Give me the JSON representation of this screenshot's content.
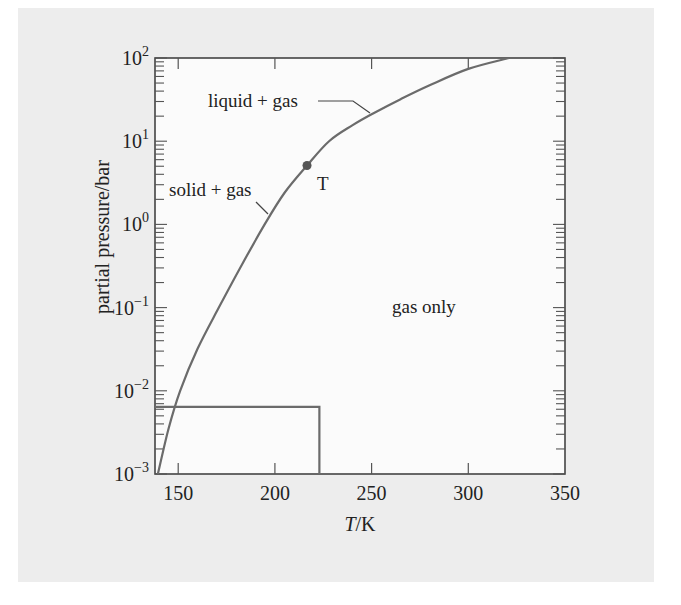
{
  "chart_data": {
    "type": "line",
    "title": "",
    "xlabel": "T/K",
    "xlabel_italic_part": "T",
    "xlabel_rest": "/K",
    "ylabel": "partial pressure/bar",
    "yscale": "log",
    "xlim": [
      138,
      350
    ],
    "ylim": [
      0.001,
      100
    ],
    "x_ticks": [
      150,
      200,
      250,
      300,
      350
    ],
    "x_tick_labels": [
      "150",
      "200",
      "250",
      "300",
      "350"
    ],
    "y_ticks": [
      0.001,
      0.01,
      0.1,
      1,
      10,
      100
    ],
    "y_tick_labels": [
      {
        "base": "10",
        "exp": "−3"
      },
      {
        "base": "10",
        "exp": "−2"
      },
      {
        "base": "10",
        "exp": "−1"
      },
      {
        "base": "10",
        "exp": "0"
      },
      {
        "base": "10",
        "exp": "1"
      },
      {
        "base": "10",
        "exp": "2"
      }
    ],
    "grid": false,
    "series": [
      {
        "name": "phase boundary",
        "color": "#6b6b6b",
        "x": [
          139.5,
          145,
          151,
          160,
          171,
          183,
          194.7,
          205,
          216.6,
          228,
          240,
          251,
          265,
          280,
          300,
          321
        ],
        "y": [
          0.001,
          0.0035,
          0.01,
          0.032,
          0.1,
          0.33,
          1.0,
          2.4,
          5.1,
          10.0,
          15.5,
          21.7,
          32,
          47,
          74,
          100
        ]
      },
      {
        "name": "reference box",
        "color": "#6b6b6b",
        "x": [
          138,
          223,
          223
        ],
        "y": [
          0.0064,
          0.0064,
          0.001
        ]
      }
    ],
    "points": [
      {
        "label": "T",
        "x": 216.6,
        "y": 5.1,
        "color": "#555555"
      }
    ],
    "annotations": [
      {
        "text": "liquid + gas",
        "x": 188,
        "y": 32,
        "leader_to": {
          "x": 251,
          "y": 21.7
        }
      },
      {
        "text": "solid + gas",
        "x": 146,
        "y": 2.7,
        "leader_to": {
          "x": 199,
          "y": 1.3
        }
      },
      {
        "text": "gas only",
        "x": 258,
        "y": 0.1
      }
    ]
  },
  "labels": {
    "triple_point": "T",
    "liquid_gas": "liquid + gas",
    "solid_gas": "solid + gas",
    "gas_only": "gas only",
    "ylabel": "partial pressure/bar",
    "xlabel_italic": "T",
    "xlabel_rest": "/K"
  }
}
